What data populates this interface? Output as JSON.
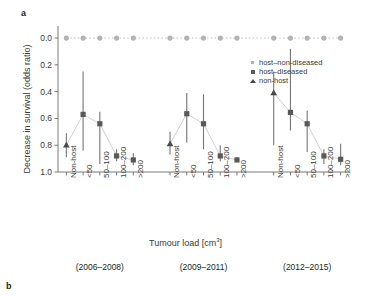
{
  "panels": {
    "a_letter": "a",
    "b_letter": "b"
  },
  "axes": {
    "ylabel": "Decrease in survival (odds ratio)",
    "xlabel_text": "Tumour load [cm",
    "xlabel_sup": "3",
    "xlabel_tail": "]",
    "yticks": [
      "1.0",
      "0.8",
      "0.6",
      "0.4",
      "0.2",
      "0.0"
    ]
  },
  "legend": {
    "items": [
      {
        "label": "host–non-diseased",
        "icon": "small-square-light",
        "color": "#b3b3b3"
      },
      {
        "label": "host–diseased",
        "icon": "square-dark",
        "color": "#595959"
      },
      {
        "label": "non-host",
        "icon": "triangle-dark",
        "color": "#4a4a4a"
      }
    ]
  },
  "groups": [
    {
      "label": "(2006–2008)"
    },
    {
      "label": "(2009–2011)"
    },
    {
      "label": "(2012–2015)"
    }
  ],
  "chart_data": {
    "type": "scatter",
    "title": "",
    "xlabel": "Tumour load [cm3]",
    "ylabel": "Decrease in survival (odds ratio)",
    "ylim": [
      0.0,
      1.05
    ],
    "yticks": [
      0.0,
      0.2,
      0.4,
      0.6,
      0.8,
      1.0
    ],
    "grid": false,
    "legend_position": "upper-right-inside",
    "categories": [
      "Non-host",
      "<50",
      "50–100",
      "100–200",
      ">200"
    ],
    "group_labels": [
      "(2006–2008)",
      "(2009–2011)",
      "(2012–2015)"
    ],
    "series": [
      {
        "name": "host–non-diseased",
        "marker": "circle",
        "color": "#b3b3b3",
        "linestyle": "dotted",
        "points": [
          {
            "group": "(2006–2008)",
            "category": "Non-host",
            "value": 1.0,
            "low": 1.0,
            "high": 1.0
          },
          {
            "group": "(2006–2008)",
            "category": "<50",
            "value": 1.0,
            "low": 1.0,
            "high": 1.0
          },
          {
            "group": "(2006–2008)",
            "category": "50–100",
            "value": 1.0,
            "low": 1.0,
            "high": 1.0
          },
          {
            "group": "(2006–2008)",
            "category": "100–200",
            "value": 1.0,
            "low": 1.0,
            "high": 1.0
          },
          {
            "group": "(2006–2008)",
            "category": ">200",
            "value": 1.0,
            "low": 1.0,
            "high": 1.0
          },
          {
            "group": "(2009–2011)",
            "category": "Non-host",
            "value": 1.0,
            "low": 1.0,
            "high": 1.0
          },
          {
            "group": "(2009–2011)",
            "category": "<50",
            "value": 1.0,
            "low": 1.0,
            "high": 1.0
          },
          {
            "group": "(2009–2011)",
            "category": "50–100",
            "value": 1.0,
            "low": 1.0,
            "high": 1.0
          },
          {
            "group": "(2009–2011)",
            "category": "100–200",
            "value": 1.0,
            "low": 1.0,
            "high": 1.0
          },
          {
            "group": "(2009–2011)",
            "category": ">200",
            "value": 1.0,
            "low": 1.0,
            "high": 1.0
          },
          {
            "group": "(2012–2015)",
            "category": "Non-host",
            "value": 1.0,
            "low": 1.0,
            "high": 1.0
          },
          {
            "group": "(2012–2015)",
            "category": "<50",
            "value": 1.0,
            "low": 1.0,
            "high": 1.0
          },
          {
            "group": "(2012–2015)",
            "category": "50–100",
            "value": 1.0,
            "low": 1.0,
            "high": 1.0
          },
          {
            "group": "(2012–2015)",
            "category": "100–200",
            "value": 1.0,
            "low": 1.0,
            "high": 1.0
          },
          {
            "group": "(2012–2015)",
            "category": ">200",
            "value": 1.0,
            "low": 1.0,
            "high": 1.0
          }
        ]
      },
      {
        "name": "non-host",
        "marker": "triangle",
        "color": "#4a4a4a",
        "points": [
          {
            "group": "(2006–2008)",
            "category": "Non-host",
            "value": 0.2,
            "low": 0.11,
            "high": 0.29
          },
          {
            "group": "(2009–2011)",
            "category": "Non-host",
            "value": 0.21,
            "low": 0.13,
            "high": 0.3
          },
          {
            "group": "(2012–2015)",
            "category": "Non-host",
            "value": 0.59,
            "low": 0.2,
            "high": 0.75
          }
        ]
      },
      {
        "name": "host–diseased",
        "marker": "square",
        "color": "#595959",
        "points": [
          {
            "group": "(2006–2008)",
            "category": "<50",
            "value": 0.43,
            "low": 0.16,
            "high": 0.75
          },
          {
            "group": "(2006–2008)",
            "category": "50–100",
            "value": 0.36,
            "low": 0.06,
            "high": 0.45
          },
          {
            "group": "(2006–2008)",
            "category": "100–200",
            "value": 0.12,
            "low": 0.08,
            "high": 0.17
          },
          {
            "group": "(2006–2008)",
            "category": ">200",
            "value": 0.09,
            "low": 0.05,
            "high": 0.14
          },
          {
            "group": "(2009–2011)",
            "category": "<50",
            "value": 0.435,
            "low": 0.22,
            "high": 0.59
          },
          {
            "group": "(2009–2011)",
            "category": "50–100",
            "value": 0.36,
            "low": 0.17,
            "high": 0.58
          },
          {
            "group": "(2009–2011)",
            "category": "100–200",
            "value": 0.12,
            "low": 0.08,
            "high": 0.2
          },
          {
            "group": "(2009–2011)",
            "category": ">200",
            "value": 0.09,
            "low": 0.08,
            "high": 0.11
          },
          {
            "group": "(2012–2015)",
            "category": "<50",
            "value": 0.445,
            "low": 0.31,
            "high": 0.92
          },
          {
            "group": "(2012–2015)",
            "category": "50–100",
            "value": 0.36,
            "low": 0.15,
            "high": 0.46
          },
          {
            "group": "(2012–2015)",
            "category": "100–200",
            "value": 0.12,
            "low": 0.06,
            "high": 0.17
          },
          {
            "group": "(2012–2015)",
            "category": ">200",
            "value": 0.095,
            "low": 0.05,
            "high": 0.21
          }
        ]
      }
    ]
  }
}
